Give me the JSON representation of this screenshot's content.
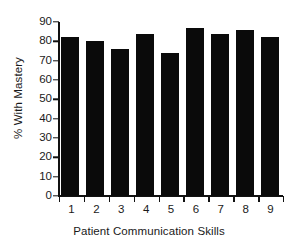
{
  "chart_data": {
    "type": "bar",
    "title": "",
    "subtitle": "",
    "xlabel": "Patient Communication Skills",
    "ylabel": "% With Mastery",
    "categories": [
      "1",
      "2",
      "3",
      "4",
      "5",
      "6",
      "7",
      "8",
      "9"
    ],
    "values": [
      82,
      80,
      76,
      84,
      74,
      87,
      84,
      86,
      82
    ],
    "series": [
      {
        "name": "% With Mastery",
        "values": [
          82,
          80,
          76,
          84,
          74,
          87,
          84,
          86,
          82
        ]
      }
    ],
    "ylim": [
      0,
      90
    ],
    "ytick_labels": [
      "0",
      "10",
      "20",
      "30",
      "40",
      "50",
      "60",
      "70",
      "80",
      "90"
    ],
    "ytick_values": [
      0,
      10,
      20,
      30,
      40,
      50,
      60,
      70,
      80,
      90
    ],
    "xtick_labels": [
      "1",
      "2",
      "3",
      "4",
      "5",
      "6",
      "7",
      "8",
      "9"
    ],
    "grid": false,
    "legend": false,
    "legend_position": "none",
    "bar_color": "#0a0a0a",
    "axis_color": "#111111",
    "text_color": "#1a1a1a",
    "background_color": "#ffffff",
    "annotations": []
  }
}
